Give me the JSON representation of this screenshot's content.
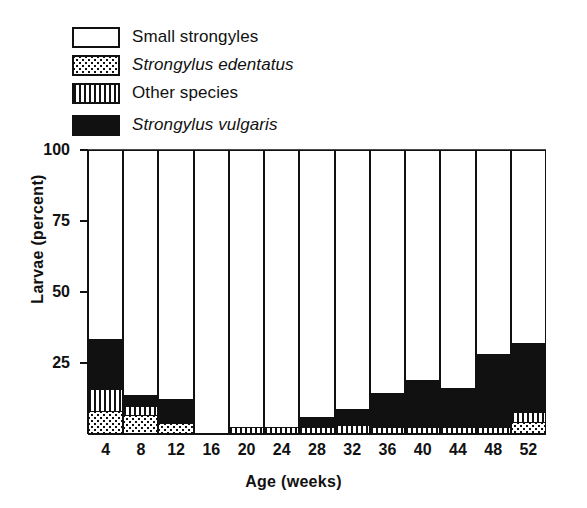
{
  "legend": {
    "items": [
      {
        "label": "Small strongyles",
        "pattern": "white",
        "italic": false
      },
      {
        "label": "Strongylus edentatus",
        "pattern": "dots",
        "italic": true
      },
      {
        "label": "Other species",
        "pattern": "stripes",
        "italic": false
      },
      {
        "label": "Strongylus vulgaris",
        "pattern": "black",
        "italic": true
      }
    ]
  },
  "chart_data": {
    "type": "bar",
    "stacked": true,
    "title": "",
    "xlabel": "Age (weeks)",
    "ylabel": "Larvae (percent)",
    "categories": [
      4,
      8,
      12,
      16,
      20,
      24,
      28,
      32,
      36,
      40,
      44,
      48,
      52
    ],
    "xticklabels": [
      "4",
      "8",
      "12",
      "16",
      "20",
      "24",
      "28",
      "32",
      "36",
      "40",
      "44",
      "48",
      "52"
    ],
    "yticklabels": [
      "100",
      "75",
      "50",
      "25"
    ],
    "yticks": [
      100,
      75,
      50,
      25
    ],
    "ylim": [
      0,
      100
    ],
    "grid": false,
    "legend_position": "above-plot",
    "colors": {
      "small_strongyles": "#ffffff",
      "strongylus_edentatus": "#ffffff",
      "other_species": "#ffffff",
      "strongylus_vulgaris": "#111111",
      "outline": "#111111"
    },
    "series": [
      {
        "name": "Strongylus edentatus",
        "pattern": "dots",
        "values": [
          7.7,
          6.3,
          3.5,
          0,
          0,
          0,
          0,
          0,
          0,
          0,
          0,
          0,
          4
        ]
      },
      {
        "name": "Other species",
        "pattern": "stripes",
        "values": [
          7.8,
          3.2,
          0,
          0,
          2,
          2,
          2,
          2.8,
          2,
          2,
          2,
          2,
          3.5
        ]
      },
      {
        "name": "Strongylus vulgaris",
        "pattern": "black",
        "values": [
          17.5,
          3.8,
          8.5,
          0,
          0,
          0,
          3.5,
          5.7,
          12,
          16.8,
          14,
          25.8,
          24.2
        ]
      },
      {
        "name": "Small strongyles",
        "pattern": "white",
        "values": [
          67,
          86.7,
          88,
          100,
          98,
          98,
          94.5,
          91.5,
          86,
          81.2,
          84,
          72.2,
          68.3
        ]
      }
    ],
    "series_totals_note": "Each bar sums to 100 percent"
  }
}
